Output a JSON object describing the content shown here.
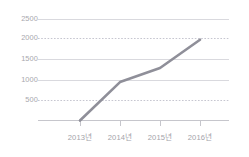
{
  "chart_data": {
    "type": "line",
    "title": "",
    "subtitle": "",
    "xlabel": "",
    "ylabel": "",
    "categories": [
      "2013년",
      "2014년",
      "2015년",
      "2016년"
    ],
    "series": [
      {
        "name": "",
        "values": [
          0,
          950,
          1300,
          2000
        ]
      }
    ],
    "ylim": [
      0,
      2750
    ],
    "y_ticks": [
      500,
      1000,
      1500,
      2000,
      2500
    ],
    "y_tick_labels": [
      "500",
      "1000",
      "1500",
      "2000",
      "2500"
    ],
    "gridlines": {
      "visible": true,
      "solid_at": [
        1000,
        1500,
        2500
      ],
      "dotted_at": [
        500,
        2000
      ],
      "color": "#d9d9de",
      "dotted_color": "#c9c9d2"
    },
    "axis": {
      "baseline_color": "#c6c6cc",
      "tick_marks_at": [
        "2013년",
        "2014년",
        "2015년",
        "2016년"
      ],
      "tick_color": "#c6c6cc"
    },
    "legend": {
      "visible": false,
      "position": "none",
      "entries": []
    },
    "line_style": {
      "color": "#8f8f99",
      "width": 2.6,
      "markers": false
    },
    "markers": [],
    "annotations": []
  }
}
